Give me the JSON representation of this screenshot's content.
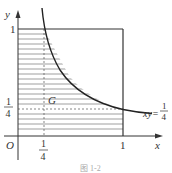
{
  "figure": {
    "axis_x_label": "x",
    "axis_y_label": "y",
    "origin_label": "O",
    "tick_x_one": "1",
    "tick_y_one": "1",
    "quarter_num": "1",
    "quarter_den": "4",
    "region_label": "G",
    "curve_label_prefix": "xy=",
    "curve_label_num": "1",
    "curve_label_den": "4",
    "caption": "图 1-2"
  },
  "geometry": {
    "origin_px": [
      18,
      136
    ],
    "unit_x_px": 105,
    "unit_y_px": 107,
    "curve": "xy = 1/4",
    "square": [
      [
        0,
        0
      ],
      [
        1,
        1
      ]
    ],
    "shaded_region": "0<=x<=1, 0<=y<=min(1, 1/(4x))",
    "dashed_lines": [
      "x = 1/4",
      "y = 1/4"
    ]
  }
}
